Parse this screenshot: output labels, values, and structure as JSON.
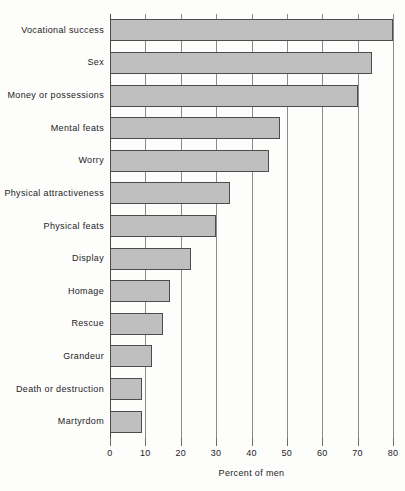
{
  "chart_data": {
    "type": "bar",
    "orientation": "horizontal",
    "title": "",
    "xlabel": "Percent of men",
    "ylabel": "",
    "xlim": [
      0,
      80
    ],
    "xticks": [
      0,
      10,
      20,
      30,
      40,
      50,
      60,
      70,
      80
    ],
    "grid": true,
    "legend": null,
    "bar_color": "#bfbfbf",
    "bar_edge_color": "#4d4d4d",
    "categories": [
      "Vocational success",
      "Sex",
      "Money or possessions",
      "Mental feats",
      "Worry",
      "Physical attractiveness",
      "Physical feats",
      "Display",
      "Homage",
      "Rescue",
      "Grandeur",
      "Death or destruction",
      "Martyrdom"
    ],
    "values": [
      80,
      74,
      70,
      48,
      45,
      34,
      30,
      23,
      17,
      15,
      12,
      9,
      9
    ]
  }
}
